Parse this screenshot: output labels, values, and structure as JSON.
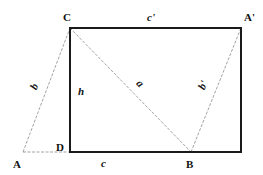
{
  "diagram": {
    "vertices": {
      "A": {
        "label": "A",
        "x": 23,
        "y": 152
      },
      "D": {
        "label": "D",
        "x": 70,
        "y": 152
      },
      "B": {
        "label": "B",
        "x": 191,
        "y": 152
      },
      "C": {
        "label": "C",
        "x": 70,
        "y": 28
      },
      "A_prime": {
        "label": "A'",
        "x": 241,
        "y": 28
      },
      "E": {
        "label": "",
        "x": 241,
        "y": 152
      }
    },
    "side_labels": {
      "b": "b",
      "h": "h",
      "a": "a",
      "b_prime": "b'",
      "c": "c",
      "c_prime": "c'"
    },
    "solid_edges": [
      "C-A'",
      "A'-E",
      "E-D",
      "D-C"
    ],
    "dashed_edges": [
      "A-C",
      "A-D",
      "C-B",
      "B-A'"
    ],
    "colors": {
      "solid": "#1a1a1a",
      "dashed": "#9a9a9a"
    }
  }
}
